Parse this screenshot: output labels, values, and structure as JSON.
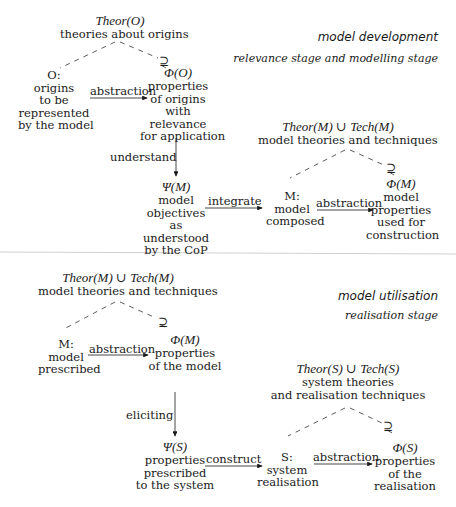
{
  "dev": {
    "title": "model development",
    "subtitle": [
      "relevance stage and",
      "modelling stage"
    ],
    "theor_o": {
      "math": "Theor(O)",
      "text": "theories about origins"
    },
    "o": {
      "lines": [
        "O:",
        "origins",
        "to be",
        "represented",
        "by the model"
      ]
    },
    "phi_o": {
      "math": "Φ(O)",
      "lines": [
        "properties",
        "of origins",
        "with",
        "relevance",
        "for application"
      ]
    },
    "abstraction1": "abstraction",
    "understand": "understand",
    "psi_m": {
      "math": "Ψ(M)",
      "lines": [
        "model",
        "objectives",
        "as",
        "understood",
        "by the CoP"
      ]
    },
    "integrate": "integrate",
    "theor_m": {
      "math": "Theor(M) ∪ Tech(M)",
      "text": "model theories and techniques"
    },
    "m": {
      "lines": [
        "M:",
        "model",
        "composed"
      ]
    },
    "abstraction2": "abstraction",
    "phi_m": {
      "math": "Φ(M)",
      "lines": [
        "model",
        "properties",
        "used for",
        "construction"
      ]
    }
  },
  "util": {
    "title": "model utilisation",
    "subtitle": [
      "realisation stage"
    ],
    "theor_m": {
      "math": "Theor(M) ∪ Tech(M)",
      "text": "model theories and techniques"
    },
    "m": {
      "lines": [
        "M:",
        "model",
        "prescribed"
      ]
    },
    "abstraction1": "abstraction",
    "phi_m": {
      "math": "Φ(M)",
      "lines": [
        "properties",
        "of the model"
      ]
    },
    "eliciting": "eliciting",
    "psi_s": {
      "math": "Ψ(S)",
      "lines": [
        "properties",
        "prescribed",
        "to the system"
      ]
    },
    "construct": "construct",
    "theor_s": {
      "math": "Theor(S) ∪ Tech(S)",
      "lines": [
        "system theories",
        "and realisation techniques"
      ]
    },
    "s": {
      "lines": [
        "S:",
        "system",
        "realisation"
      ]
    },
    "abstraction2": "abstraction",
    "phi_s": {
      "math": "Φ(S)",
      "lines": [
        "properties",
        "of the",
        "realisation"
      ]
    }
  },
  "symbols": {
    "supseteq": "⊇"
  },
  "colors": {
    "ink": "#1a1a1a",
    "divider": "#d0d0d0"
  }
}
